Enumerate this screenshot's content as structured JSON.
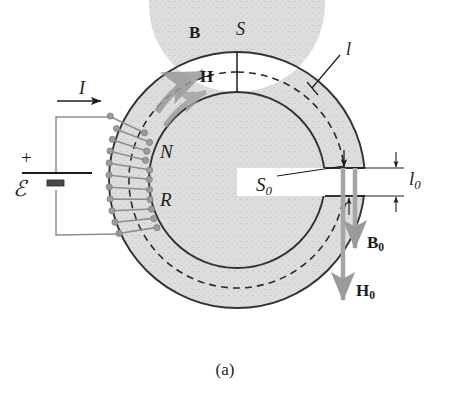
{
  "figure": {
    "caption": "(a)",
    "background_color": "#ffffff",
    "ink_color": "#1c1c1c",
    "core_fill_color": "#dcdcdc",
    "core_stroke_color": "#333333",
    "coil_color": "#8a8a8a",
    "field_arrow_color": "#9a9a9a",
    "dashed_path_color": "#2a2a2a"
  },
  "labels": {
    "B": {
      "text": "B",
      "style": "bold",
      "x": 189,
      "y": 28
    },
    "S": {
      "text": "S",
      "style": "italic",
      "x": 238,
      "y": 22
    },
    "l": {
      "text": "l",
      "style": "italic",
      "x": 345,
      "y": 46
    },
    "H": {
      "text": "H",
      "style": "bold",
      "x": 200,
      "y": 72
    },
    "I": {
      "text": "I",
      "style": "italic",
      "x": 78,
      "y": 84
    },
    "N": {
      "text": "N",
      "style": "italic",
      "x": 160,
      "y": 148
    },
    "R": {
      "text": "R",
      "style": "italic",
      "x": 160,
      "y": 196
    },
    "emf": {
      "text": "ℰ",
      "style": "italic",
      "x": 14,
      "y": 184
    },
    "plus": {
      "text": "+",
      "style": "plain",
      "x": 22,
      "y": 154
    },
    "S0": {
      "base": "S",
      "subscript": "0",
      "x": 256,
      "y": 180
    },
    "l0": {
      "base": "l",
      "subscript": "0",
      "x": 408,
      "y": 171
    },
    "B0": {
      "base": "B",
      "subscript": "0",
      "style": "bold",
      "x": 367,
      "y": 240
    },
    "H0": {
      "base": "H",
      "subscript": "0",
      "style": "bold",
      "x": 357,
      "y": 288
    }
  },
  "geometry": {
    "center_x": 237,
    "center_y": 180,
    "outer_radius": 128,
    "inner_radius": 88,
    "mean_radius": 108,
    "gap_top_y": 168,
    "gap_bottom_y": 196,
    "gap_height_px": 28,
    "coil_turns_drawn": 11,
    "coil_arc_start_deg": 150,
    "coil_arc_end_deg": 215
  },
  "circuit": {
    "battery_plus_terminal": "+",
    "emf_symbol": "ℰ",
    "current_symbol": "I",
    "current_direction": "right"
  },
  "field_vectors": [
    {
      "name": "B",
      "location": "inside core, upper-left",
      "direction": "clockwise along core"
    },
    {
      "name": "H",
      "location": "inside core, upper-left",
      "direction": "clockwise along core"
    },
    {
      "name": "B0",
      "location": "air gap",
      "direction": "downward"
    },
    {
      "name": "H0",
      "location": "air gap",
      "direction": "downward"
    }
  ]
}
